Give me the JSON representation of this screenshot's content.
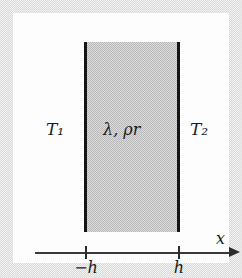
{
  "figure": {
    "type": "physics-slab-diagram",
    "background_color": "#e8e8e8",
    "plate_color": "#fdfdfd"
  },
  "slab": {
    "fill_color": "#c8c8c8",
    "edge_color": "#151515",
    "left_boundary_value": "-h",
    "right_boundary_value": "h",
    "material_label": "λ, ρr"
  },
  "temperatures": {
    "left_label": "T₁",
    "right_label": "T₂"
  },
  "axis": {
    "name_label": "x",
    "line_color": "#3a3a3a",
    "ticks": [
      {
        "label": "−h",
        "value": "-h"
      },
      {
        "label": "h",
        "value": "h"
      }
    ]
  }
}
